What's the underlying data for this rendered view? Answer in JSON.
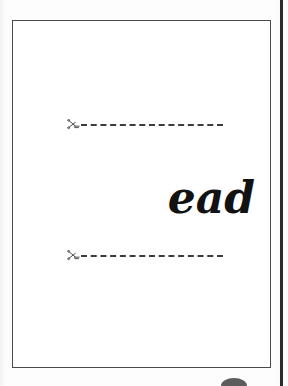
{
  "document": {
    "type": "worksheet-flashcard-page",
    "page": {
      "border_color": "#4a4a4a",
      "background_color": "#ffffff"
    },
    "background_color": "#fdfdfd",
    "divider_color": "#2b2b2b"
  },
  "content": {
    "word": "ead",
    "word_color": "#121212"
  },
  "cut_lines": [
    {
      "id": "cut-line-top",
      "icon": "scissors-icon",
      "label": "",
      "style": "dashed",
      "color": "#3c3c3c"
    },
    {
      "id": "cut-line-bottom",
      "icon": "scissors-icon",
      "label": "",
      "style": "dashed",
      "color": "#3c3c3c"
    }
  ]
}
